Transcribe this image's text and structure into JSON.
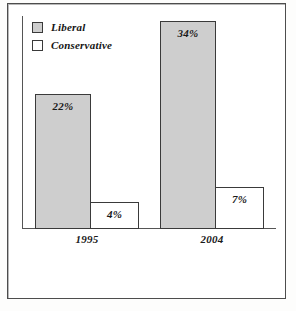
{
  "frame": {
    "border_color": "#4d4d4d",
    "background": "#ffffff"
  },
  "legend": {
    "items": [
      {
        "label": "Liberal",
        "swatch": "gray-swatch-icon",
        "color": "#cecece"
      },
      {
        "label": "Conservative",
        "swatch": "white-swatch-icon",
        "color": "#ffffff"
      }
    ]
  },
  "chart_data": {
    "type": "bar",
    "title": "",
    "subtitle": "",
    "xlabel": "",
    "ylabel": "",
    "categories": [
      "1995",
      "2004"
    ],
    "series": [
      {
        "name": "Liberal",
        "color": "#cecece",
        "values": [
          22,
          34
        ],
        "labels": [
          "22%",
          "34%"
        ]
      },
      {
        "name": "Conservative",
        "color": "#ffffff",
        "values": [
          4,
          7
        ],
        "labels": [
          "4%",
          "7%"
        ]
      }
    ],
    "ylim": [
      0,
      37
    ],
    "grid": false,
    "legend_position": "top-left",
    "value_label_suffix": "%",
    "annotations": []
  }
}
